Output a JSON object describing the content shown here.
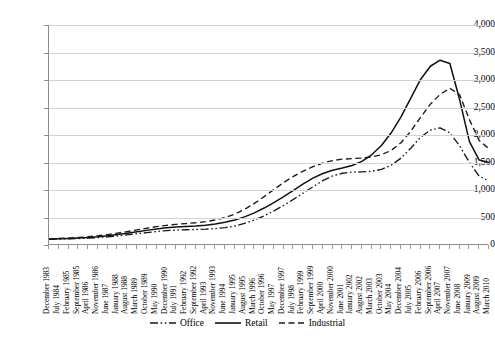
{
  "chart_data": {
    "type": "line",
    "title": "",
    "subtitle": "",
    "xlabel": "",
    "ylabel": "",
    "ylim": [
      0,
      4000
    ],
    "ytick_labels": [
      "4,000",
      "3,500",
      "3,000",
      "2,500",
      "2,000",
      "1,500",
      "1,000",
      "500",
      "0"
    ],
    "ytick_values": [
      4000,
      3500,
      3000,
      2500,
      2000,
      1500,
      1000,
      500,
      0
    ],
    "grid": true,
    "legend_position": "bottom",
    "categories": [
      "December 1983",
      "July 1984",
      "February 1985",
      "September 1985",
      "April 1986",
      "November 1986",
      "June 1987",
      "January 1988",
      "August 1988",
      "March 1989",
      "October 1989",
      "May 1990",
      "December 1990",
      "July 1991",
      "February 1992",
      "September 1992",
      "April 1993",
      "November 1993",
      "June 1994",
      "January 1995",
      "August 1995",
      "March 1996",
      "October 1996",
      "May 1997",
      "December 1997",
      "July 1998",
      "February 1999",
      "September 1999",
      "April 2000",
      "November 2000",
      "June 2001",
      "January 2002",
      "August 2002",
      "March 2003",
      "October 2003",
      "May 2004",
      "December 2004",
      "July 2005",
      "February 2006",
      "September 2006",
      "April 2007",
      "November 2007",
      "June 2008",
      "January 2009",
      "August 2009",
      "March 2010"
    ],
    "series": [
      {
        "name": "Office",
        "style": "dash-dot-dot",
        "color": "#1a1a1a",
        "values": [
          105,
          108,
          112,
          118,
          125,
          135,
          148,
          165,
          185,
          205,
          225,
          245,
          262,
          272,
          278,
          282,
          288,
          298,
          315,
          345,
          392,
          455,
          530,
          620,
          720,
          830,
          945,
          1060,
          1170,
          1255,
          1305,
          1325,
          1330,
          1340,
          1375,
          1450,
          1580,
          1760,
          1960,
          2090,
          2130,
          2040,
          1800,
          1500,
          1250,
          1165
        ]
      },
      {
        "name": "Retail",
        "style": "solid",
        "color": "#111111",
        "values": [
          108,
          112,
          118,
          126,
          136,
          150,
          168,
          190,
          214,
          240,
          266,
          292,
          312,
          326,
          336,
          346,
          360,
          382,
          412,
          455,
          512,
          585,
          672,
          772,
          880,
          995,
          1110,
          1215,
          1300,
          1360,
          1400,
          1445,
          1520,
          1640,
          1810,
          2040,
          2330,
          2670,
          3010,
          3250,
          3360,
          3300,
          2640,
          1880,
          1545,
          1500
        ]
      },
      {
        "name": "Industrial",
        "style": "dashed",
        "color": "#1a1a1a",
        "values": [
          112,
          118,
          126,
          136,
          150,
          168,
          190,
          216,
          244,
          274,
          304,
          334,
          358,
          376,
          390,
          404,
          424,
          454,
          498,
          562,
          648,
          756,
          880,
          1010,
          1135,
          1248,
          1345,
          1425,
          1490,
          1535,
          1560,
          1572,
          1580,
          1600,
          1640,
          1720,
          1860,
          2070,
          2320,
          2560,
          2740,
          2850,
          2730,
          2280,
          1900,
          1750
        ]
      }
    ]
  },
  "legend": {
    "items": [
      {
        "label": "Office",
        "swatch": "dash-dot-dot-line-icon"
      },
      {
        "label": "Retail",
        "swatch": "solid-line-icon"
      },
      {
        "label": "Industrial",
        "swatch": "dashed-line-icon"
      }
    ]
  }
}
